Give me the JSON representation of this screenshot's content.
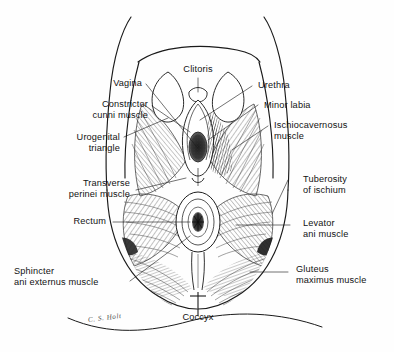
{
  "figure": {
    "domain": "anatomical-illustration",
    "signature": "C. S. Holt",
    "background_color": "#fefefe",
    "ink_color": "#1a1a1a",
    "label_color": "#121212"
  },
  "labels": {
    "clitoris": "Clitoris",
    "vagina": "Vagina",
    "constrictor_cunni_muscle": "Constrictor\ncunni muscle",
    "urogenital_triangle": "Urogenital\ntriangle",
    "transverse_perinei_muscle": "Transverse\nperinei muscle",
    "rectum": "Rectum",
    "sphincter_ani_externus_muscle": "Sphincter\nani externus muscle",
    "urethra": "Urethra",
    "minor_labia": "Minor labia",
    "ischiocavernosus_muscle": "Ischiocavernosus\nmuscle",
    "tuberosity_of_ischium": "Tuberosity\nof ischium",
    "levator_ani_muscle": "Levator\nani muscle",
    "gluteus_maximus_muscle": "Gluteus\nmaximus muscle",
    "coccyx": "Coccyx"
  }
}
